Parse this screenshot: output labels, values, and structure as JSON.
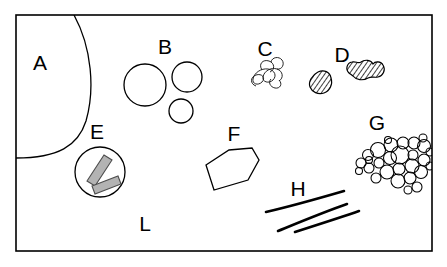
{
  "figure": {
    "background_color": "#ffffff",
    "line_color": "#000000",
    "fill_gray": "#b3b3b3",
    "frame": {
      "name": "outer-frame",
      "x": 16,
      "y": 15,
      "width": 416,
      "height": 236,
      "stroke_color": "#000000"
    }
  },
  "labels": [
    {
      "id": "A",
      "text": "A",
      "x": 40,
      "y": 70,
      "feature": "large-arc-boundary"
    },
    {
      "id": "B",
      "text": "B",
      "x": 165,
      "y": 54,
      "feature": "circle-cluster"
    },
    {
      "id": "C",
      "text": "C",
      "x": 265,
      "y": 56,
      "feature": "squiggle-coil"
    },
    {
      "id": "D",
      "text": "D",
      "x": 342,
      "y": 62,
      "feature": "hatched-blobs"
    },
    {
      "id": "E",
      "text": "E",
      "x": 97,
      "y": 139,
      "feature": "circled-laths"
    },
    {
      "id": "F",
      "text": "F",
      "x": 234,
      "y": 141,
      "feature": "hexagonal-outline"
    },
    {
      "id": "G",
      "text": "G",
      "x": 377,
      "y": 130,
      "feature": "bubble-aggregate"
    },
    {
      "id": "H",
      "text": "H",
      "x": 298,
      "y": 196,
      "feature": "streak-lines"
    },
    {
      "id": "L",
      "text": "L",
      "x": 145,
      "y": 231,
      "feature": "matrix-groundmass"
    }
  ],
  "features": {
    "A": {
      "name": "large-arc-boundary",
      "type": "arc",
      "description": "Large curved boundary sweeping from top edge down to the left edge"
    },
    "B": {
      "name": "circle-cluster",
      "type": "circles",
      "count": 3,
      "circles": [
        {
          "cx": 145,
          "cy": 85,
          "r": 21
        },
        {
          "cx": 187,
          "cy": 77,
          "r": 15
        },
        {
          "cx": 181,
          "cy": 111,
          "r": 12
        }
      ]
    },
    "C": {
      "name": "squiggle-coil",
      "type": "coiled-line",
      "description": "Small tangled coiled filament"
    },
    "D": {
      "name": "hatched-blobs",
      "type": "hatched-polygons",
      "count": 2,
      "description": "Two angular blobs with diagonal hatch fill"
    },
    "E": {
      "name": "circled-laths",
      "type": "circle-with-laths",
      "circle": {
        "cx": 100,
        "cy": 172,
        "r": 25
      },
      "lath_count": 2,
      "lath_fill": "#b3b3b3"
    },
    "F": {
      "name": "hexagonal-outline",
      "type": "polygon",
      "sides": 6,
      "description": "Irregular elongated hexagonal crystal outline"
    },
    "G": {
      "name": "bubble-aggregate",
      "type": "circle-aggregate",
      "count": 28,
      "description": "Dense aggregate of small touching circles"
    },
    "H": {
      "name": "streak-lines",
      "type": "lines",
      "count": 3,
      "description": "Three slightly curved sub-parallel streaks"
    },
    "L": {
      "name": "matrix-groundmass",
      "type": "label-only",
      "description": "Label pointing at the undifferentiated background matrix"
    }
  }
}
